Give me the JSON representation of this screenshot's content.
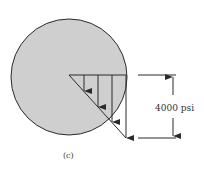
{
  "figure": {
    "stress_label": "4000 psi",
    "caption": "(c)",
    "colors": {
      "disk_fill": "#cfcfcf",
      "stroke": "#2a2a2a",
      "background": "#ffffff"
    }
  }
}
